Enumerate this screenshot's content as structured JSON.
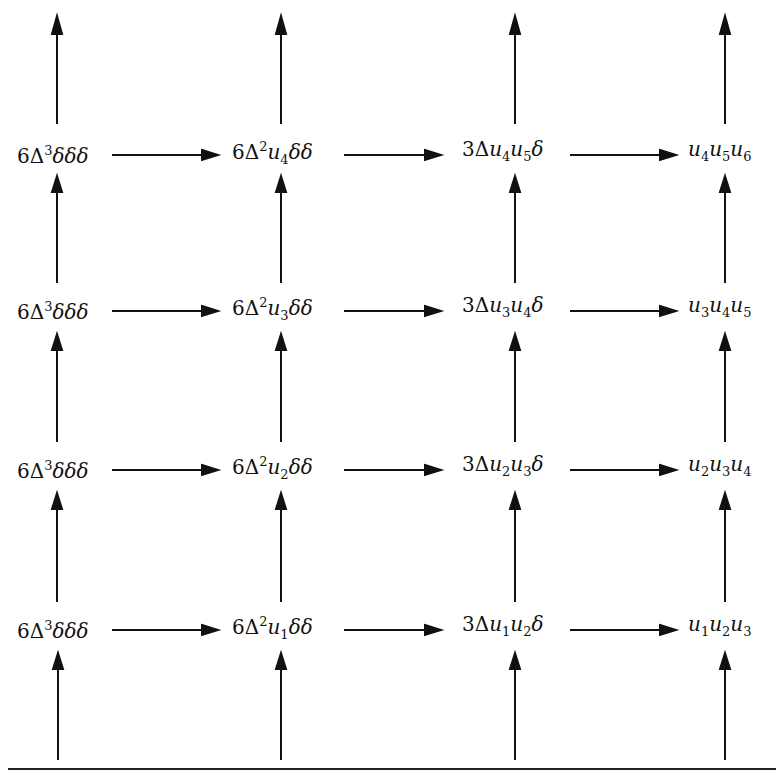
{
  "diagram": {
    "type": "commutative-grid",
    "rows": [
      {
        "row": 4,
        "nodes": [
          {
            "coef": "6",
            "delta": "Δ",
            "delta_exp": "3",
            "vars": [],
            "deltas": "δδδ"
          },
          {
            "coef": "6",
            "delta": "Δ",
            "delta_exp": "2",
            "vars": [
              {
                "v": "u",
                "i": "4"
              }
            ],
            "deltas": "δδ"
          },
          {
            "coef": "3",
            "delta": "Δ",
            "delta_exp": "",
            "vars": [
              {
                "v": "u",
                "i": "4"
              },
              {
                "v": "u",
                "i": "5"
              }
            ],
            "deltas": "δ"
          },
          {
            "coef": "",
            "delta": "",
            "delta_exp": "",
            "vars": [
              {
                "v": "u",
                "i": "4"
              },
              {
                "v": "u",
                "i": "5"
              },
              {
                "v": "u",
                "i": "6"
              }
            ],
            "deltas": ""
          }
        ]
      },
      {
        "row": 3,
        "nodes": [
          {
            "coef": "6",
            "delta": "Δ",
            "delta_exp": "3",
            "vars": [],
            "deltas": "δδδ"
          },
          {
            "coef": "6",
            "delta": "Δ",
            "delta_exp": "2",
            "vars": [
              {
                "v": "u",
                "i": "3"
              }
            ],
            "deltas": "δδ"
          },
          {
            "coef": "3",
            "delta": "Δ",
            "delta_exp": "",
            "vars": [
              {
                "v": "u",
                "i": "3"
              },
              {
                "v": "u",
                "i": "4"
              }
            ],
            "deltas": "δ"
          },
          {
            "coef": "",
            "delta": "",
            "delta_exp": "",
            "vars": [
              {
                "v": "u",
                "i": "3"
              },
              {
                "v": "u",
                "i": "4"
              },
              {
                "v": "u",
                "i": "5"
              }
            ],
            "deltas": ""
          }
        ]
      },
      {
        "row": 2,
        "nodes": [
          {
            "coef": "6",
            "delta": "Δ",
            "delta_exp": "3",
            "vars": [],
            "deltas": "δδδ"
          },
          {
            "coef": "6",
            "delta": "Δ",
            "delta_exp": "2",
            "vars": [
              {
                "v": "u",
                "i": "2"
              }
            ],
            "deltas": "δδ"
          },
          {
            "coef": "3",
            "delta": "Δ",
            "delta_exp": "",
            "vars": [
              {
                "v": "u",
                "i": "2"
              },
              {
                "v": "u",
                "i": "3"
              }
            ],
            "deltas": "δ"
          },
          {
            "coef": "",
            "delta": "",
            "delta_exp": "",
            "vars": [
              {
                "v": "u",
                "i": "2"
              },
              {
                "v": "u",
                "i": "3"
              },
              {
                "v": "u",
                "i": "4"
              }
            ],
            "deltas": ""
          }
        ]
      },
      {
        "row": 1,
        "nodes": [
          {
            "coef": "6",
            "delta": "Δ",
            "delta_exp": "3",
            "vars": [],
            "deltas": "δδδ"
          },
          {
            "coef": "6",
            "delta": "Δ",
            "delta_exp": "2",
            "vars": [
              {
                "v": "u",
                "i": "1"
              }
            ],
            "deltas": "δδ"
          },
          {
            "coef": "3",
            "delta": "Δ",
            "delta_exp": "",
            "vars": [
              {
                "v": "u",
                "i": "1"
              },
              {
                "v": "u",
                "i": "2"
              }
            ],
            "deltas": "δ"
          },
          {
            "coef": "",
            "delta": "",
            "delta_exp": "",
            "vars": [
              {
                "v": "u",
                "i": "1"
              },
              {
                "v": "u",
                "i": "2"
              },
              {
                "v": "u",
                "i": "3"
              }
            ],
            "deltas": ""
          }
        ]
      }
    ],
    "labels": [
      [
        "6Δ³δδδ",
        "6Δ²u₄δδ",
        "3Δu₄u₅δ",
        "u₄u₅u₆"
      ],
      [
        "6Δ³δδδ",
        "6Δ²u₃δδ",
        "3Δu₃u₄δ",
        "u₃u₄u₅"
      ],
      [
        "6Δ³δδδ",
        "6Δ²u₂δδ",
        "3Δu₂u₃δ",
        "u₂u₃u₄"
      ],
      [
        "6Δ³δδδ",
        "6Δ²u₁δδ",
        "3Δu₁u₂δ",
        "u₁u₂u₃"
      ]
    ],
    "arrows": {
      "horizontal": "left-to-right between adjacent nodes in each row",
      "vertical": "upward in each column, continuing above top row and from below bottom row"
    }
  }
}
